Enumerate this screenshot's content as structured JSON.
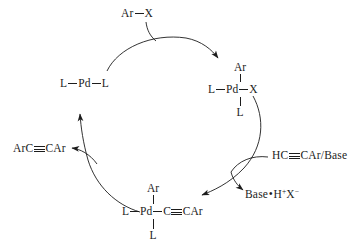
{
  "diagram": {
    "ink_color": "#1c1c1c",
    "background_color": "#ffffff"
  },
  "species": {
    "aryl_halide": {
      "name": "aryl-halide-reagent",
      "left": "Ar",
      "right": "X"
    },
    "pd0": {
      "name": "pd0-complex",
      "left": "L",
      "center": "Pd",
      "right": "L"
    },
    "oxidative_addition_product": {
      "name": "aryl-palladium-halide-complex",
      "top": "Ar",
      "left": "L",
      "center": "Pd",
      "right": "X",
      "bottom": "L"
    },
    "transmetalation_product": {
      "name": "aryl-alkynyl-palladium-complex",
      "top": "Ar",
      "left": "L",
      "center": "Pd",
      "right_first": "C",
      "right_rest": "CAr",
      "bottom": "L"
    },
    "alkyne_reagent": {
      "name": "terminal-alkyne-base-reagent",
      "head": "HC",
      "tail": "CAr/Base"
    },
    "byproduct": {
      "name": "base-hydrohalide-byproduct",
      "base": "Base",
      "separator": "•",
      "h": "H",
      "h_charge": "+",
      "x": "X",
      "x_charge": "−"
    },
    "product": {
      "name": "diaryl-alkyne-product",
      "head": "ArC",
      "tail": "CAr"
    }
  }
}
